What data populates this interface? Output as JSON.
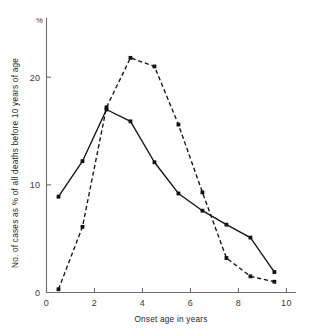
{
  "chart_data": {
    "type": "line",
    "title": "",
    "subtitle": "",
    "xlabel": "Onset age in years",
    "ylabel": "No. of cases as % of all deaths before 10 years of age",
    "unit_label": "%",
    "xlim": [
      0,
      10.4
    ],
    "ylim": [
      0,
      25.5
    ],
    "xticks": [
      0,
      2,
      4,
      6,
      8,
      10
    ],
    "xticklabels": [
      "0",
      "2",
      "4",
      "6",
      "8",
      "10"
    ],
    "yticks": [
      0,
      10,
      20
    ],
    "yticklabels": [
      "0",
      "10",
      "20"
    ],
    "grid": false,
    "legend": "none",
    "x": [
      0.5,
      1.5,
      2.5,
      3.5,
      4.5,
      5.5,
      6.5,
      7.5,
      8.5,
      9.5
    ],
    "series": [
      {
        "name": "solid-series",
        "linestyle": "solid",
        "color": "#111111",
        "marker": "square",
        "values": [
          8.9,
          12.2,
          17.0,
          15.9,
          12.1,
          9.2,
          7.6,
          6.3,
          5.1,
          1.9
        ]
      },
      {
        "name": "dashed-series",
        "linestyle": "dashed",
        "color": "#111111",
        "marker": "square",
        "values": [
          0.3,
          6.1,
          17.2,
          21.8,
          21.0,
          15.6,
          9.3,
          3.2,
          1.5,
          1.0
        ]
      }
    ]
  },
  "axes": {
    "x_title": "Onset age in years",
    "y_title": "No. of cases as % of all deaths before 10 years of age",
    "percent_symbol": "%",
    "xticklabels": [
      "0",
      "2",
      "4",
      "6",
      "8",
      "10"
    ],
    "yticklabels": [
      "0",
      "10",
      "20"
    ]
  }
}
